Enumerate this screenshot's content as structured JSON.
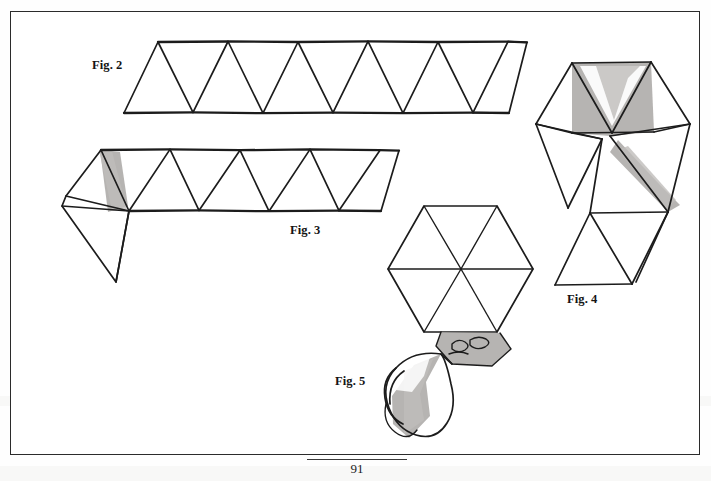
{
  "page": {
    "kind": "scanned-book-figure-plate",
    "page_number": "91",
    "top_partial_text": "",
    "background_color": "#ffffff",
    "ink_color": "#1c1c1c",
    "shade_color": "#a9a7a4",
    "frame_color": "#2b2b2b"
  },
  "labels": {
    "fig2": "Fig. 2",
    "fig3": "Fig. 3",
    "fig4": "Fig. 4",
    "fig5": "Fig. 5"
  },
  "figures": [
    {
      "id": "fig-2",
      "label": "Fig. 2",
      "description": "Flat strip of ten equilateral triangles in a zig-zag band, unfolded, drawn in outline only with no shading.",
      "triangle_count": 10,
      "shaded": false
    },
    {
      "id": "fig-3",
      "label": "Fig. 3",
      "description": "Strip of triangles with the left end folded back under itself, forming a diamond tab; a narrow grey shaded facet marks the fold.",
      "triangle_count": 8,
      "shaded": true
    },
    {
      "id": "fig-4",
      "label": "Fig. 4",
      "description": "Partly collapsed strip bent into a zig-zag stack of triangles, grey shading showing two folded-over faces.",
      "shaded": true
    },
    {
      "id": "fig-5",
      "label": "Fig. 5",
      "description": "Completed hexagonal hexaflexagon of six triangles with a hand holding it, shown as a shaded cylindrical sleeve.",
      "triangle_count": 6,
      "shaded": true
    }
  ]
}
